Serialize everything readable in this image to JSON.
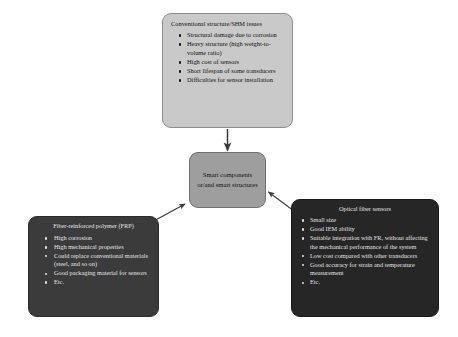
{
  "diagram": {
    "colors": {
      "top_fill": "#c9c9c9",
      "center_fill": "#9e9e9e",
      "left_fill": "#3b3b3b",
      "right_fill": "#262626",
      "arrow": "#3a3a3a",
      "background": "#ffffff"
    },
    "nodes": {
      "conventional": {
        "title": "Conventional structure/SHM issues",
        "items": [
          "Structural damage due to corrosion",
          "Heavy structure (high weight-to-volume ratio)",
          "High cost of sensors",
          "Short lifespan of some transducers",
          "Difficulties for sensor installation"
        ]
      },
      "center": {
        "text": "Smart components or/and smart structures"
      },
      "frp": {
        "title": "Fiber-reinforced polymer (FRP)",
        "items": [
          "High corrosion",
          "High mechanical properties",
          "Could replace conventional materials (steel, and so on)",
          "Good packaging material for sensors",
          "Etc."
        ]
      },
      "optical": {
        "title": "Optical fiber sensors",
        "items": [
          "Small size",
          "Good IEM ability",
          "Suitable integration with FR, without affecting the mechanical performance of the system",
          "Low cost compared with other transducers",
          "Good accuracy for strain and temperature measurement",
          "Etc."
        ]
      }
    },
    "arrows": [
      {
        "name": "conventional-to-center",
        "from": "conventional",
        "to": "center",
        "direction": "down"
      },
      {
        "name": "frp-to-center",
        "from": "frp",
        "to": "center",
        "direction": "up-right"
      },
      {
        "name": "optical-to-center",
        "from": "optical",
        "to": "center",
        "direction": "up-left"
      }
    ]
  }
}
